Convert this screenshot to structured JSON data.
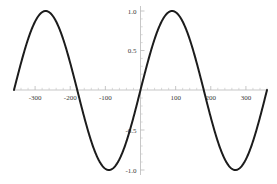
{
  "chart_data": {
    "type": "line",
    "title": "",
    "subtitle": "",
    "xlabel": "",
    "ylabel": "",
    "function": "sin(x)",
    "x_unit": "degrees",
    "xlim": [
      -360,
      360
    ],
    "ylim": [
      -1.0,
      1.0
    ],
    "grid": false,
    "legend": false,
    "legend_position": "none",
    "x_tick_labels": [
      "-300",
      "-200",
      "-100",
      "100",
      "200",
      "300"
    ],
    "x_tick_values": [
      -300,
      -200,
      -100,
      100,
      200,
      300
    ],
    "x_minor_tick_step": 20,
    "y_tick_labels": [
      "1.0",
      "0.5",
      "-0.5",
      "-1.0"
    ],
    "y_tick_values": [
      1.0,
      0.5,
      -0.5,
      -1.0
    ],
    "y_minor_tick_step": 0.1,
    "series": [
      {
        "name": "sin(x)",
        "color": "#1c1c1c",
        "x": [
          -360,
          -350,
          -340,
          -330,
          -320,
          -310,
          -300,
          -290,
          -280,
          -270,
          -260,
          -250,
          -240,
          -230,
          -220,
          -210,
          -200,
          -190,
          -180,
          -170,
          -160,
          -150,
          -140,
          -130,
          -120,
          -110,
          -100,
          -90,
          -80,
          -70,
          -60,
          -50,
          -40,
          -30,
          -20,
          -10,
          0,
          10,
          20,
          30,
          40,
          50,
          60,
          70,
          80,
          90,
          100,
          110,
          120,
          130,
          140,
          150,
          160,
          170,
          180,
          190,
          200,
          210,
          220,
          230,
          240,
          250,
          260,
          270,
          280,
          290,
          300,
          310,
          320,
          330,
          340,
          350,
          360
        ],
        "y": [
          0.0,
          0.174,
          0.342,
          0.5,
          0.643,
          0.766,
          0.866,
          0.94,
          0.985,
          1.0,
          0.985,
          0.94,
          0.866,
          0.766,
          0.643,
          0.5,
          0.342,
          0.174,
          0.0,
          -0.174,
          -0.342,
          -0.5,
          -0.643,
          -0.766,
          -0.866,
          -0.94,
          -0.985,
          -1.0,
          -0.985,
          -0.94,
          -0.866,
          -0.766,
          -0.643,
          -0.5,
          -0.342,
          -0.174,
          0.0,
          0.174,
          0.342,
          0.5,
          0.643,
          0.766,
          0.866,
          0.94,
          0.985,
          1.0,
          0.985,
          0.94,
          0.866,
          0.766,
          0.643,
          0.5,
          0.342,
          0.174,
          0.0,
          -0.174,
          -0.342,
          -0.5,
          -0.643,
          -0.766,
          -0.866,
          -0.94,
          -0.985,
          -1.0,
          -0.985,
          -0.94,
          -0.866,
          -0.766,
          -0.643,
          -0.5,
          -0.342,
          -0.174,
          0.0
        ]
      }
    ],
    "annotations": [],
    "peaks": [
      {
        "x": -270,
        "y": 1.0
      },
      {
        "x": 90,
        "y": 1.0
      }
    ],
    "troughs": [
      {
        "x": -90,
        "y": -1.0
      },
      {
        "x": 270,
        "y": -1.0
      }
    ],
    "colors": {
      "curve": "#1c1c1c",
      "axis": "#b9b9b9",
      "tick": "#c9c9c9",
      "label": "#3a3a3a",
      "background": "#ffffff"
    }
  }
}
